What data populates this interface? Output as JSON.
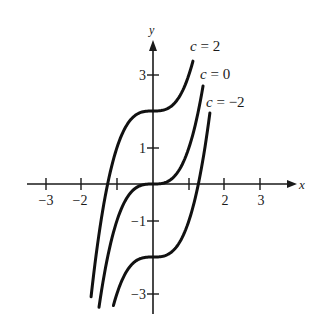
{
  "chart_data": {
    "type": "line",
    "title": "",
    "xlabel": "x",
    "ylabel": "y",
    "xlim": [
      -3.4,
      3.9
    ],
    "ylim": [
      -3.5,
      3.9
    ],
    "grid": false,
    "x_ticks": [
      -3,
      -2,
      -1,
      1,
      2,
      3
    ],
    "x_tick_labels": [
      "−3",
      "−2",
      "",
      "",
      "2",
      "3"
    ],
    "y_ticks": [
      3,
      1,
      -1,
      -3
    ],
    "y_tick_labels": [
      "3",
      "1",
      "−1",
      "−3"
    ],
    "function": "y = x^3 + c",
    "series": [
      {
        "name": "c = 2",
        "c": 2,
        "x_range": [
          -1.72,
          1.11
        ]
      },
      {
        "name": "c = 0",
        "c": 0,
        "x_range": [
          -1.5,
          1.39
        ]
      },
      {
        "name": "c = −2",
        "c": -2,
        "x_range": [
          -1.1,
          1.58
        ]
      }
    ],
    "annotations": [
      {
        "text": "c = 2",
        "x": 190,
        "y": 51
      },
      {
        "text": "c = 0",
        "x": 200,
        "y": 79
      },
      {
        "text": "c = −2",
        "x": 206,
        "y": 107
      }
    ]
  },
  "labels": {
    "x_axis": "x",
    "y_axis": "y",
    "curve_c2": "c = 2",
    "curve_c0": "c = 0",
    "curve_cm2": "c = −2",
    "tick_x_m3": "−3",
    "tick_x_m2": "−2",
    "tick_x_2": "2",
    "tick_x_3": "3",
    "tick_y_3": "3",
    "tick_y_1": "1",
    "tick_y_m1": "−1",
    "tick_y_m3": "−3"
  },
  "colors": {
    "ink": "#111111",
    "background": "#ffffff"
  }
}
